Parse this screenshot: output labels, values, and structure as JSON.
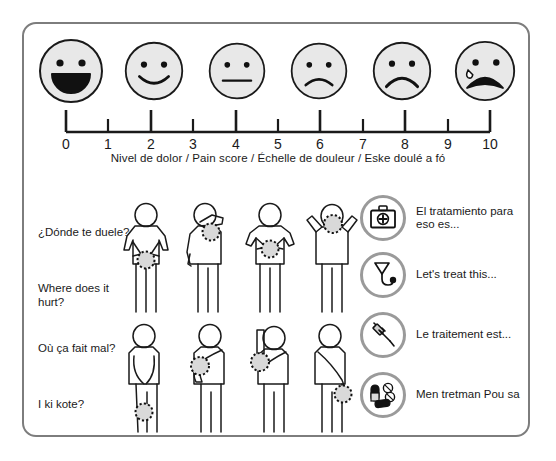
{
  "card": {
    "title": "Multilingual pain scale and body-location communication chart"
  },
  "pain_scale": {
    "caption": "Nivel de dolor / Pain score / Échelle de douleur / Eske doulé a fó",
    "tick_labels": [
      "0",
      "1",
      "2",
      "3",
      "4",
      "5",
      "6",
      "7",
      "8",
      "9",
      "10"
    ],
    "faces": [
      {
        "score": "0",
        "expression": "big-open-smile",
        "name": "face-score-0"
      },
      {
        "score": "2",
        "expression": "smile",
        "name": "face-score-2"
      },
      {
        "score": "4",
        "expression": "neutral",
        "name": "face-score-4"
      },
      {
        "score": "6",
        "expression": "frown",
        "name": "face-score-6"
      },
      {
        "score": "8",
        "expression": "deep-frown",
        "name": "face-score-8"
      },
      {
        "score": "10",
        "expression": "crying-open-mouth",
        "name": "face-score-10"
      }
    ]
  },
  "prompts": {
    "spanish": "¿Dónde te duele?",
    "english": "Where does it hurt?",
    "french": "Où ça fait mal?",
    "creole": "I ki kote?"
  },
  "body_figures": [
    {
      "name": "figure-pelvis-pain",
      "row": 0,
      "col": 0,
      "pose": "hands-on-hips",
      "pain_location": "lower-abdomen"
    },
    {
      "name": "figure-shoulder-pain",
      "row": 0,
      "col": 1,
      "pose": "hand-to-shoulder",
      "pain_location": "shoulder"
    },
    {
      "name": "figure-stomach-pain",
      "row": 0,
      "col": 2,
      "pose": "hands-on-stomach",
      "pain_location": "stomach"
    },
    {
      "name": "figure-head-pain",
      "row": 0,
      "col": 3,
      "pose": "hands-behind-head",
      "pain_location": "head-neck"
    },
    {
      "name": "figure-knee-pain",
      "row": 1,
      "col": 0,
      "pose": "bending-forward",
      "pain_location": "knee"
    },
    {
      "name": "figure-chest-pain",
      "row": 1,
      "col": 1,
      "pose": "arm-across-chest",
      "pain_location": "chest"
    },
    {
      "name": "figure-armpit-pain",
      "row": 1,
      "col": 2,
      "pose": "arm-raised",
      "pain_location": "armpit"
    },
    {
      "name": "figure-hand-pain",
      "row": 1,
      "col": 3,
      "pose": "arm-down",
      "pain_location": "hand-wrist"
    }
  ],
  "treatments": [
    {
      "name": "treatment-spanish",
      "icon": "first-aid-kit-icon",
      "text": "El tratamiento para eso es..."
    },
    {
      "name": "treatment-english",
      "icon": "stethoscope-icon",
      "text": "Let's treat this..."
    },
    {
      "name": "treatment-french",
      "icon": "syringe-icon",
      "text": "Le traitement est..."
    },
    {
      "name": "treatment-creole",
      "icon": "pills-icon",
      "text": "Men tretman Pou sa"
    }
  ],
  "colors": {
    "face_fill": "#e8e8e8",
    "outline": "#1a1a1a",
    "border": "#7d7d7d",
    "icon_ring": "#9a9a9a",
    "pain_spot": "#d9d9d9"
  }
}
